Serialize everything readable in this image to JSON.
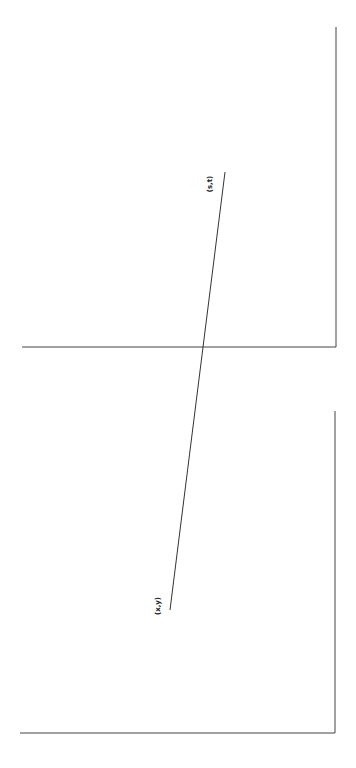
{
  "diagram": {
    "labels": {
      "start_point": "(x,y)",
      "end_point": "(s,t)"
    },
    "colors": {
      "line": "#333333",
      "background": "#ffffff"
    }
  }
}
